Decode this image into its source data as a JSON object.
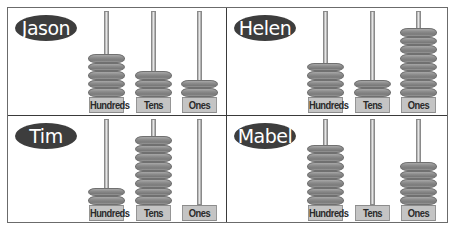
{
  "diagram": {
    "type": "abacus-comparison",
    "column_labels": [
      "Hundreds",
      "Tens",
      "Ones"
    ],
    "panels": [
      {
        "name": "Jason",
        "beads": {
          "hundreds": 5,
          "tens": 3,
          "ones": 2
        },
        "value": 532
      },
      {
        "name": "Helen",
        "beads": {
          "hundreds": 4,
          "tens": 2,
          "ones": 8
        },
        "value": 428
      },
      {
        "name": "Tim",
        "beads": {
          "hundreds": 2,
          "tens": 8,
          "ones": 0
        },
        "value": 280
      },
      {
        "name": "Mabel",
        "beads": {
          "hundreds": 7,
          "tens": 0,
          "ones": 5
        },
        "value": 705
      }
    ],
    "colors": {
      "name_badge": "#3d3d3d",
      "bead": "#8a8a8a",
      "label_box": "#c4c4c4",
      "rod": "#cfcfcf",
      "divider": "#3a3a3a"
    }
  }
}
